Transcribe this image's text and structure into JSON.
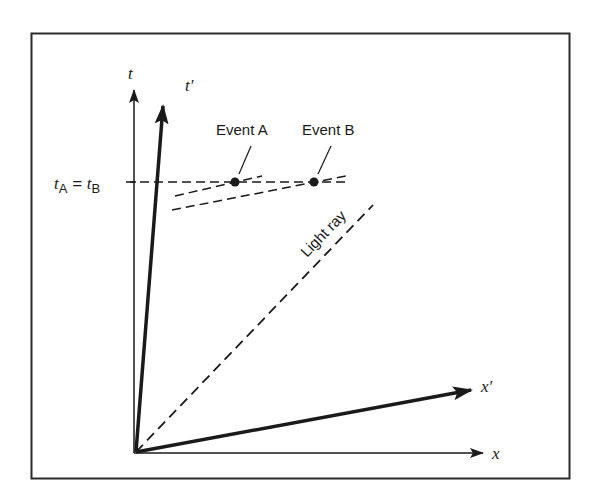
{
  "diagram": {
    "axes": {
      "t": "t",
      "t_prime": "t′",
      "x": "x",
      "x_prime": "x′"
    },
    "simultaneity_label": {
      "t1": "t",
      "sub_a": "A",
      "eq": " = ",
      "t2": "t",
      "sub_b": "B"
    },
    "events": [
      {
        "label": "Event A"
      },
      {
        "label": "Event B"
      }
    ],
    "light_ray_label": "Light ray",
    "colors": {
      "ink": "#1a1a1a",
      "background": "#ffffff"
    }
  }
}
